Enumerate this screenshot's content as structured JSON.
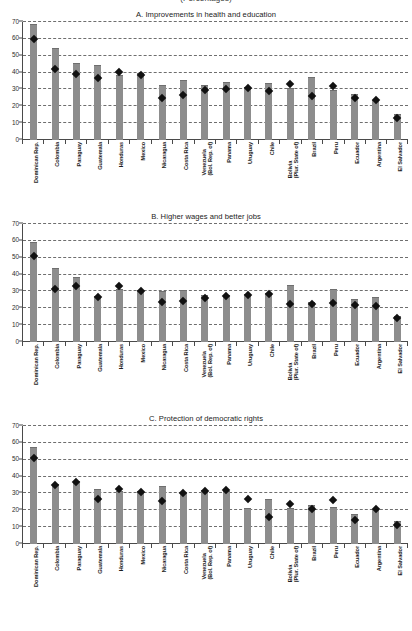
{
  "supertitle": "(Percentages)",
  "axis": {
    "yticks": [
      0,
      10,
      20,
      30,
      40,
      50,
      60,
      70
    ],
    "ymin": 0,
    "ymax": 70
  },
  "countries": [
    "Dominican Rep.",
    "Colombia",
    "Paraguay",
    "Guatemala",
    "Honduras",
    "Mexico",
    "Nicaragua",
    "Costa Rica",
    "Venezuela|(Bol. Rep. of)",
    "Panama",
    "Uruguay",
    "Chile",
    "Bolivia|(Plur. State of)",
    "Brazil",
    "Peru",
    "Ecuador",
    "Argentina",
    "El Salvador"
  ],
  "chart_data": [
    {
      "type": "bar",
      "title": "A. Improvements in health and education",
      "xlabel": "",
      "ylabel": "",
      "ylim": [
        0,
        70
      ],
      "grid": true,
      "legend": "none",
      "categories": [
        "Dominican Rep.",
        "Colombia",
        "Paraguay",
        "Guatemala",
        "Honduras",
        "Mexico",
        "Nicaragua",
        "Costa Rica",
        "Venezuela (Bol. Rep. of)",
        "Panama",
        "Uruguay",
        "Chile",
        "Bolivia (Plur. State of)",
        "Brazil",
        "Peru",
        "Ecuador",
        "Argentina",
        "El Salvador"
      ],
      "series": [
        {
          "name": "bars",
          "values": [
            68,
            54,
            45,
            44,
            38,
            39,
            32,
            35,
            32,
            34,
            31,
            33,
            30,
            37,
            29,
            27,
            23,
            15
          ]
        },
        {
          "name": "diamonds",
          "values": [
            60,
            42,
            39,
            37,
            40.5,
            38.5,
            25,
            27,
            29.5,
            30,
            31,
            29,
            33,
            26,
            32,
            25,
            24,
            13
          ]
        }
      ]
    },
    {
      "type": "bar",
      "title": "B. Higher wages and better jobs",
      "xlabel": "",
      "ylabel": "",
      "ylim": [
        0,
        70
      ],
      "grid": true,
      "legend": "none",
      "categories": [
        "Dominican Rep.",
        "Colombia",
        "Paraguay",
        "Guatemala",
        "Honduras",
        "Mexico",
        "Nicaragua",
        "Costa Rica",
        "Venezuela (Bol. Rep. of)",
        "Panama",
        "Uruguay",
        "Chile",
        "Bolivia (Plur. State of)",
        "Brazil",
        "Peru",
        "Ecuador",
        "Argentina",
        "El Salvador"
      ],
      "series": [
        {
          "name": "bars",
          "values": [
            59,
            43.5,
            38,
            27,
            31,
            30,
            29.5,
            30.5,
            27.5,
            27.5,
            28,
            28.5,
            33,
            23,
            31,
            25,
            26,
            15
          ]
        },
        {
          "name": "diamonds",
          "values": [
            51,
            31.5,
            33,
            27,
            33,
            30,
            24,
            24.5,
            26,
            27.5,
            28,
            28.5,
            22.5,
            22.5,
            23,
            22,
            21.5,
            14.5
          ]
        }
      ]
    },
    {
      "type": "bar",
      "title": "C. Protection of democratic rights",
      "xlabel": "",
      "ylabel": "",
      "ylim": [
        0,
        70
      ],
      "grid": true,
      "legend": "none",
      "categories": [
        "Dominican Rep.",
        "Colombia",
        "Paraguay",
        "Guatemala",
        "Honduras",
        "Mexico",
        "Nicaragua",
        "Costa Rica",
        "Venezuela (Bol. Rep. of)",
        "Panama",
        "Uruguay",
        "Chile",
        "Bolivia (Plur. State of)",
        "Brazil",
        "Peru",
        "Ecuador",
        "Argentina",
        "El Salvador"
      ],
      "series": [
        {
          "name": "bars",
          "values": [
            57,
            35,
            36.5,
            32,
            31,
            31,
            34,
            30,
            31.5,
            31,
            21,
            26,
            21,
            22.5,
            21.5,
            17,
            20,
            13
          ]
        },
        {
          "name": "diamonds",
          "values": [
            51,
            35,
            36.5,
            27,
            32.5,
            31,
            25.5,
            30,
            31.5,
            32,
            26.5,
            16,
            24,
            21,
            26,
            14,
            21,
            11
          ]
        }
      ]
    }
  ]
}
